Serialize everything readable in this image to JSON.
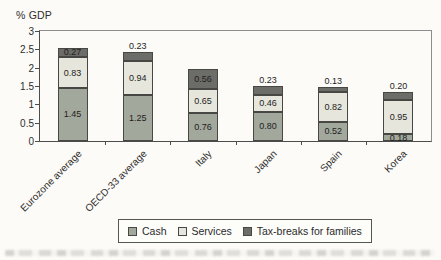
{
  "chart_data": {
    "type": "bar",
    "stacked": true,
    "title": "",
    "ylabel": "% GDP",
    "xlabel": "",
    "ylim": [
      0,
      3
    ],
    "ytick_step": 0.5,
    "ytick_labels": [
      "3",
      "2.5",
      "2",
      "1.5",
      "1",
      "0.5",
      "0"
    ],
    "grid": false,
    "legend_position": "bottom",
    "value_label_decimals": 2,
    "categories": [
      "Eurozone average",
      "OECD-33 average",
      "Italy",
      "Japan",
      "Spain",
      "Korea"
    ],
    "series": [
      {
        "name": "Cash",
        "color": "#a2a89c",
        "values": [
          1.45,
          1.25,
          0.76,
          0.8,
          0.52,
          0.18
        ]
      },
      {
        "name": "Services",
        "color": "#e6e6dc",
        "values": [
          0.83,
          0.94,
          0.65,
          0.46,
          0.82,
          0.95
        ]
      },
      {
        "name": "Tax-breaks for families",
        "color": "#6c6c68",
        "values": [
          0.27,
          0.23,
          0.56,
          0.23,
          0.13,
          0.2
        ]
      }
    ],
    "bar_totals": [
      2.55,
      2.42,
      1.97,
      1.49,
      1.47,
      1.33
    ]
  }
}
